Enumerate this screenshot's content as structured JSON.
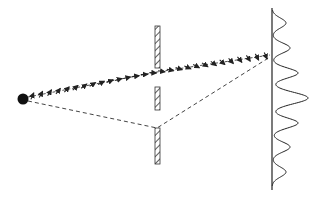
{
  "diagram": {
    "colors": {
      "background": "#ffffff",
      "stroke": "#222222",
      "dashed": "#444444",
      "hatch": "#333333"
    },
    "source": {
      "cx": 23,
      "cy": 99,
      "r": 5.5
    },
    "barrier": {
      "x": 155,
      "width": 5,
      "segments": [
        {
          "y1": 26,
          "y2": 68
        },
        {
          "y1": 87,
          "y2": 110
        },
        {
          "y1": 128,
          "y2": 164
        }
      ]
    },
    "screen": {
      "x": 272,
      "y1": 8,
      "y2": 190
    },
    "intensity_peaks": [
      {
        "cy": 23,
        "amp": 14,
        "w": 7
      },
      {
        "cy": 48,
        "amp": 18,
        "w": 7
      },
      {
        "cy": 73,
        "amp": 26,
        "w": 7
      },
      {
        "cy": 98,
        "amp": 36,
        "w": 8
      },
      {
        "cy": 123,
        "amp": 26,
        "w": 7
      },
      {
        "cy": 147,
        "amp": 18,
        "w": 7
      },
      {
        "cy": 172,
        "amp": 14,
        "w": 7
      }
    ],
    "paths": {
      "dashed_lower": [
        [
          28,
          101
        ],
        [
          157,
          128
        ],
        [
          270,
          57
        ]
      ],
      "dashed_upper": [
        [
          28,
          97
        ],
        [
          157,
          72
        ],
        [
          270,
          55
        ]
      ]
    },
    "phasor_arrow_count": 28
  }
}
